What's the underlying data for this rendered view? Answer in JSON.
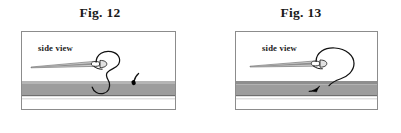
{
  "page": {
    "background_color": "#ffffff",
    "width": 401,
    "height": 133
  },
  "figures": [
    {
      "id": "fig-12",
      "caption": "Fig. 12",
      "label": "side view",
      "frame": {
        "x": 21,
        "y": 31,
        "width": 155,
        "height": 79,
        "border_color": "#8c8c8c"
      },
      "fabric": {
        "top_strip_color": "#b3b3b3",
        "main_band_color": "#9a9a9a",
        "under_line_color": "#bdbdbd",
        "base_color": "#ffffff",
        "top_strip_y": 49,
        "main_band_y": 52,
        "main_band_height": 11,
        "under_line_y": 66
      },
      "needle": {
        "color_light": "#d6d6d6",
        "color_dark": "#6e6e6e",
        "outline_color": "#3a3a3a",
        "tip_x": 9,
        "eye_x": 78
      },
      "thread": {
        "color": "#000000",
        "description": "loop curving down through fabric with short thread tail"
      }
    },
    {
      "id": "fig-13",
      "caption": "Fig. 13",
      "label": "side view",
      "frame": {
        "x": 235,
        "y": 31,
        "width": 143,
        "height": 79,
        "border_color": "#8c8c8c"
      },
      "fabric": {
        "top_strip_color": "#8e8e8e",
        "main_band_color": "#9a9a9a",
        "under_line_color": "#bdbdbd",
        "base_color": "#ffffff",
        "top_strip_y": 49,
        "main_band_y": 52,
        "main_band_height": 11,
        "under_line_y": 66
      },
      "needle": {
        "color_light": "#d6d6d6",
        "color_dark": "#6e6e6e",
        "outline_color": "#3a3a3a",
        "tip_x": 14,
        "eye_x": 84
      },
      "thread": {
        "color": "#000000",
        "description": "large loop arcing right and down into fabric with dark arrow mark"
      }
    }
  ]
}
